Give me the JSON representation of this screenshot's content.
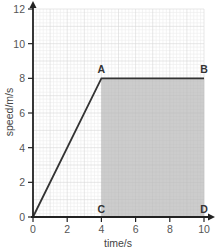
{
  "chart_data": {
    "type": "line",
    "title": "",
    "xlabel": "time/s",
    "ylabel": "speed/m/s",
    "xlim": [
      0,
      10
    ],
    "ylim": [
      0,
      12
    ],
    "x_ticks": [
      0,
      2,
      4,
      6,
      8,
      10
    ],
    "y_ticks": [
      0,
      2,
      4,
      6,
      8,
      10,
      12
    ],
    "grid": true,
    "series": [
      {
        "name": "speed",
        "x": [
          0,
          4,
          10
        ],
        "y": [
          0,
          8,
          8
        ],
        "color": "#333333"
      }
    ],
    "shaded_region": {
      "x_range": [
        4,
        10
      ],
      "y_range": [
        0,
        8
      ],
      "color": "#cccccc",
      "vertices": [
        "A",
        "B",
        "D",
        "C"
      ]
    },
    "annotations": [
      {
        "label": "A",
        "x": 4,
        "y": 8
      },
      {
        "label": "B",
        "x": 10,
        "y": 8
      },
      {
        "label": "C",
        "x": 4,
        "y": 0
      },
      {
        "label": "D",
        "x": 10,
        "y": 0
      }
    ]
  },
  "colors": {
    "grid_minor": "#ececec",
    "grid_major": "#d6d6d6",
    "axis": "#222222",
    "shade": "#cccccc",
    "line": "#333333"
  }
}
